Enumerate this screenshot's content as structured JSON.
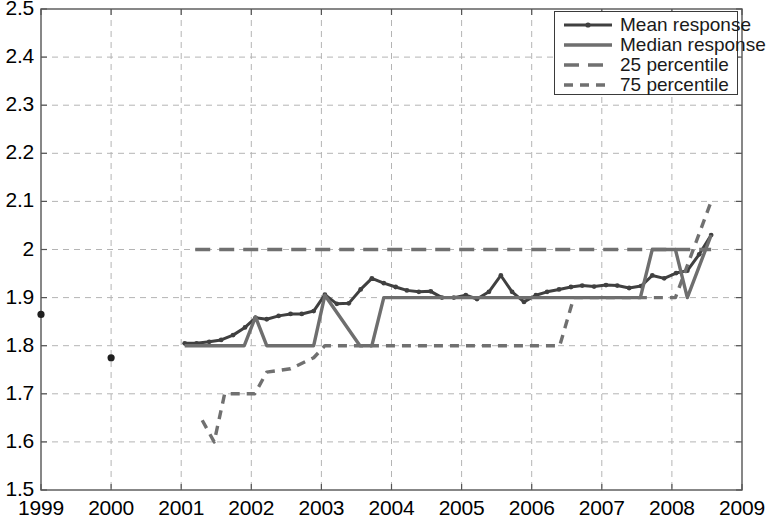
{
  "chart_data": {
    "type": "line",
    "title": "",
    "xlabel": "",
    "ylabel": "",
    "xlim": [
      1999,
      2009
    ],
    "ylim": [
      1.5,
      2.5
    ],
    "grid": true,
    "legend_position": "top-right",
    "xticks": [
      "1999",
      "2000",
      "2001",
      "2002",
      "2003",
      "2004",
      "2005",
      "2006",
      "2007",
      "2008",
      "2009"
    ],
    "yticks": [
      "1.5",
      "1.6",
      "1.7",
      "1.8",
      "1.9",
      "2",
      "2.1",
      "2.2",
      "2.3",
      "2.4",
      "2.5"
    ],
    "legend": [
      {
        "label": "Mean response",
        "style": "solid-marker",
        "color": "#404040"
      },
      {
        "label": "Median response",
        "style": "solid",
        "color": "#6e6e6e"
      },
      {
        "label": "25 percentile",
        "style": "long-dash",
        "color": "#707070"
      },
      {
        "label": "75 percentile",
        "style": "short-dash",
        "color": "#707070"
      }
    ],
    "series": [
      {
        "name": "Mean response",
        "style": "solid-marker",
        "color": "#404040",
        "points": [
          [
            2001.05,
            1.805
          ],
          [
            2001.22,
            1.805
          ],
          [
            2001.4,
            1.808
          ],
          [
            2001.57,
            1.812
          ],
          [
            2001.74,
            1.822
          ],
          [
            2001.91,
            1.838
          ],
          [
            2002.06,
            1.858
          ],
          [
            2002.22,
            1.855
          ],
          [
            2002.39,
            1.862
          ],
          [
            2002.56,
            1.866
          ],
          [
            2002.72,
            1.866
          ],
          [
            2002.89,
            1.872
          ],
          [
            2003.05,
            1.906
          ],
          [
            2003.22,
            1.887
          ],
          [
            2003.39,
            1.888
          ],
          [
            2003.56,
            1.917
          ],
          [
            2003.72,
            1.94
          ],
          [
            2003.89,
            1.93
          ],
          [
            2004.06,
            1.922
          ],
          [
            2004.22,
            1.915
          ],
          [
            2004.39,
            1.912
          ],
          [
            2004.56,
            1.913
          ],
          [
            2004.72,
            1.9
          ],
          [
            2004.89,
            1.9
          ],
          [
            2005.06,
            1.905
          ],
          [
            2005.22,
            1.897
          ],
          [
            2005.39,
            1.912
          ],
          [
            2005.56,
            1.946
          ],
          [
            2005.72,
            1.912
          ],
          [
            2005.89,
            1.891
          ],
          [
            2006.06,
            1.905
          ],
          [
            2006.22,
            1.912
          ],
          [
            2006.39,
            1.917
          ],
          [
            2006.56,
            1.922
          ],
          [
            2006.72,
            1.925
          ],
          [
            2006.89,
            1.923
          ],
          [
            2007.06,
            1.926
          ],
          [
            2007.22,
            1.925
          ],
          [
            2007.39,
            1.92
          ],
          [
            2007.56,
            1.924
          ],
          [
            2007.72,
            1.946
          ],
          [
            2007.89,
            1.94
          ],
          [
            2008.06,
            1.951
          ],
          [
            2008.22,
            1.956
          ],
          [
            2008.39,
            1.99
          ],
          [
            2008.56,
            2.03
          ]
        ]
      },
      {
        "name": "Median response",
        "style": "solid",
        "color": "#6e6e6e",
        "points": [
          [
            2001.05,
            1.8
          ],
          [
            2001.9,
            1.8
          ],
          [
            2002.06,
            1.86
          ],
          [
            2002.22,
            1.8
          ],
          [
            2002.89,
            1.8
          ],
          [
            2003.05,
            1.905
          ],
          [
            2003.55,
            1.8
          ],
          [
            2003.72,
            1.8
          ],
          [
            2003.89,
            1.9
          ],
          [
            2007.55,
            1.9
          ],
          [
            2007.72,
            2.0
          ],
          [
            2008.05,
            2.0
          ],
          [
            2008.22,
            1.9
          ],
          [
            2008.56,
            2.03
          ]
        ]
      },
      {
        "name": "25 percentile",
        "style": "long-dash",
        "color": "#707070",
        "points": [
          [
            2001.2,
            2.0
          ],
          [
            2008.56,
            2.0
          ]
        ]
      },
      {
        "name": "75 percentile",
        "style": "short-dash",
        "color": "#707070",
        "points": [
          [
            2001.3,
            1.645
          ],
          [
            2001.47,
            1.6
          ],
          [
            2001.62,
            1.7
          ],
          [
            2002.05,
            1.7
          ],
          [
            2002.22,
            1.745
          ],
          [
            2002.56,
            1.752
          ],
          [
            2002.89,
            1.775
          ],
          [
            2003.05,
            1.8
          ],
          [
            2006.4,
            1.8
          ],
          [
            2006.6,
            1.9
          ],
          [
            2008.05,
            1.9
          ],
          [
            2008.56,
            2.1
          ]
        ]
      }
    ],
    "scatter_points": [
      {
        "x": 1999.0,
        "y": 1.865,
        "series": "Mean response"
      },
      {
        "x": 2000.0,
        "y": 1.775,
        "series": "Mean response"
      }
    ]
  },
  "axes": {
    "frame_color": "#555555",
    "grid_color": "#b4b4b4"
  }
}
